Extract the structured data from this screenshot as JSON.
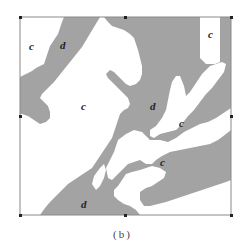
{
  "figure": {
    "caption": "(b)",
    "colors": {
      "class_d": "#a3a3a3",
      "class_c": "#ffffff",
      "frame": "#8a8a8a",
      "tick": "#222222"
    },
    "labels": [
      {
        "text": "c",
        "x": 29,
        "y": 41
      },
      {
        "text": "d",
        "x": 60,
        "y": 40
      },
      {
        "text": "c",
        "x": 208,
        "y": 29
      },
      {
        "text": "c",
        "x": 81,
        "y": 101
      },
      {
        "text": "d",
        "x": 150,
        "y": 101
      },
      {
        "text": "c",
        "x": 179,
        "y": 118
      },
      {
        "text": "c",
        "x": 160,
        "y": 157
      },
      {
        "text": "d",
        "x": 81,
        "y": 199
      }
    ]
  }
}
